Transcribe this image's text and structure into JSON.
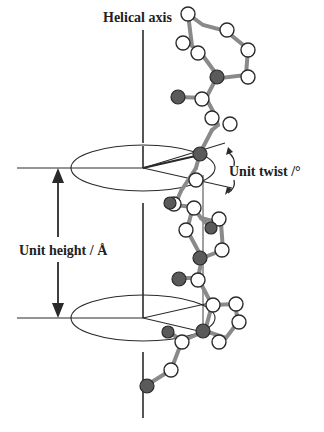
{
  "figure": {
    "labels": {
      "helical_axis": "Helical axis",
      "unit_twist": "Unit twist /°",
      "unit_height": "Unit height / Å"
    },
    "colors": {
      "line": "#2a2a2a",
      "bond": "#7a7a7a",
      "atom_dark": "#555555",
      "atom_light": "#ffffff"
    }
  }
}
